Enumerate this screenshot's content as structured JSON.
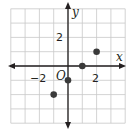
{
  "chart_data": {
    "type": "scatter",
    "title": "",
    "xlabel": "x",
    "ylabel": "y",
    "origin_label": "O",
    "xlim": [
      -4,
      4
    ],
    "ylim": [
      -4,
      4
    ],
    "grid": true,
    "grid_step": 1,
    "x_tick_labels": [
      {
        "value": -2,
        "label": "−2"
      },
      {
        "value": 2,
        "label": "2"
      }
    ],
    "y_tick_labels": [
      {
        "value": 2,
        "label": "2"
      }
    ],
    "points": [
      {
        "x": -1,
        "y": -2
      },
      {
        "x": 0,
        "y": -1
      },
      {
        "x": 1,
        "y": 0
      },
      {
        "x": 2,
        "y": 1
      }
    ],
    "colors": {
      "grid": "#c8c8c8",
      "axis": "#231f20",
      "point": "#3a3a3a"
    }
  }
}
